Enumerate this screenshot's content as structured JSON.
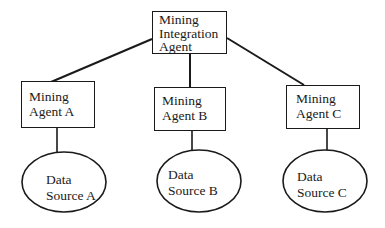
{
  "diagram": {
    "type": "hierarchy",
    "colors": {
      "background": "#ffffff",
      "stroke": "#1a1a1a",
      "text": "#1a1a1a"
    },
    "root": {
      "id": "mining-integration-agent",
      "shape": "rectangle",
      "lines": [
        "Mining",
        "Integration",
        "Agent"
      ]
    },
    "agents": [
      {
        "id": "mining-agent-a",
        "shape": "rectangle",
        "lines": [
          "Mining",
          "Agent A"
        ]
      },
      {
        "id": "mining-agent-b",
        "shape": "rectangle",
        "lines": [
          "Mining",
          "Agent B"
        ]
      },
      {
        "id": "mining-agent-c",
        "shape": "rectangle",
        "lines": [
          "Mining",
          "Agent C"
        ]
      }
    ],
    "sources": [
      {
        "id": "data-source-a",
        "shape": "ellipse",
        "lines": [
          "Data",
          "Source A"
        ]
      },
      {
        "id": "data-source-b",
        "shape": "ellipse",
        "lines": [
          "Data",
          "Source B"
        ]
      },
      {
        "id": "data-source-c",
        "shape": "ellipse",
        "lines": [
          "Data",
          "Source C"
        ]
      }
    ],
    "edges": [
      {
        "from": "mining-integration-agent",
        "to": "mining-agent-a"
      },
      {
        "from": "mining-integration-agent",
        "to": "mining-agent-b"
      },
      {
        "from": "mining-integration-agent",
        "to": "mining-agent-c"
      },
      {
        "from": "mining-agent-a",
        "to": "data-source-a"
      },
      {
        "from": "mining-agent-b",
        "to": "data-source-b"
      },
      {
        "from": "mining-agent-c",
        "to": "data-source-c"
      }
    ]
  }
}
